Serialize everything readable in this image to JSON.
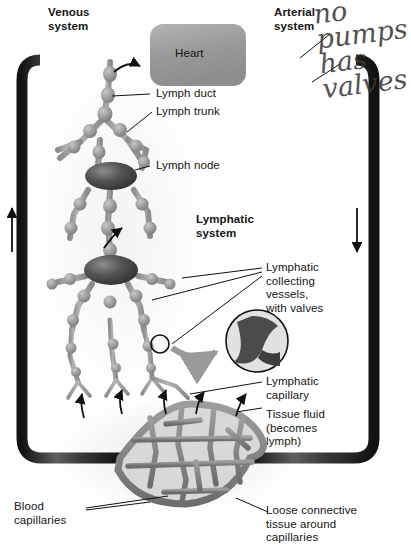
{
  "diagram": {
    "background_color": "#ffffff"
  },
  "colors": {
    "vessel_dark": "#2f2f2f",
    "vessel_mid": "#6f6f6f",
    "lymph_vessel": "#9a9a9a",
    "lymph_node": "#4a4a4a",
    "heart_fill": "#a0a0a0",
    "capillary_bed": "#8a8a8a",
    "label_text": "#141414",
    "handwriting": "#3a3a3a"
  },
  "labels": {
    "venous_system": "Venous\nsystem",
    "arterial_system": "Arterial\nsystem",
    "heart": "Heart",
    "lymph_duct": "Lymph duct",
    "lymph_trunk": "Lymph trunk",
    "lymph_node": "Lymph node",
    "lymphatic_system": "Lymphatic\nsystem",
    "collecting_vessels": "Lymphatic\ncollecting\nvessels,\nwith valves",
    "lymphatic_capillary": "Lymphatic\ncapillary",
    "tissue_fluid": "Tissue fluid\n(becomes\nlymph)",
    "blood_capillaries": "Blood\ncapillaries",
    "loose_connective": "Loose connective\ntissue around\ncapillaries"
  },
  "annotation": {
    "handwritten_note": "no\npumps\nhas\nvalves",
    "style": "handwritten-pen"
  },
  "flow_arrows": {
    "left_direction": "up",
    "right_direction": "down",
    "lymph_flow": "toward heart"
  },
  "inset": {
    "name": "valve-closeup",
    "description": "magnified view of a lymphatic valve"
  }
}
